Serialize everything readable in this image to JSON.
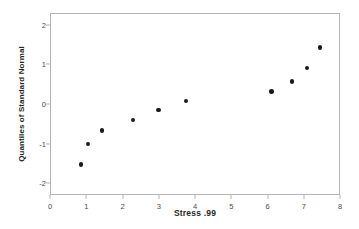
{
  "chart_data": {
    "type": "scatter",
    "title": "",
    "xlabel": "Stress .99",
    "ylabel": "Quantiles of Standard Normal",
    "xlim": [
      0,
      8
    ],
    "ylim": [
      -2.3,
      2.3
    ],
    "xticks": [
      "0",
      "1",
      "2",
      "3",
      "4",
      "5",
      "6",
      "7",
      "8"
    ],
    "xtick_values": [
      0,
      1,
      2,
      3,
      4,
      5,
      6,
      7,
      8
    ],
    "yticks": [
      "2",
      "1",
      "0",
      "-1",
      "-2"
    ],
    "ytick_values": [
      2,
      1,
      0,
      -1,
      -2
    ],
    "grid": false,
    "legend": null,
    "marker": "filled-circle",
    "marker_color": "#1a1a1a",
    "frame_color": "#b4b4b4",
    "points": [
      {
        "x": 0.82,
        "y": -1.5
      },
      {
        "x": 1.02,
        "y": -0.98
      },
      {
        "x": 1.4,
        "y": -0.64
      },
      {
        "x": 2.27,
        "y": -0.38
      },
      {
        "x": 2.96,
        "y": -0.13
      },
      {
        "x": 3.72,
        "y": 0.1
      },
      {
        "x": 6.08,
        "y": 0.34
      },
      {
        "x": 6.65,
        "y": 0.59
      },
      {
        "x": 7.07,
        "y": 0.93
      },
      {
        "x": 7.42,
        "y": 1.45
      }
    ]
  }
}
